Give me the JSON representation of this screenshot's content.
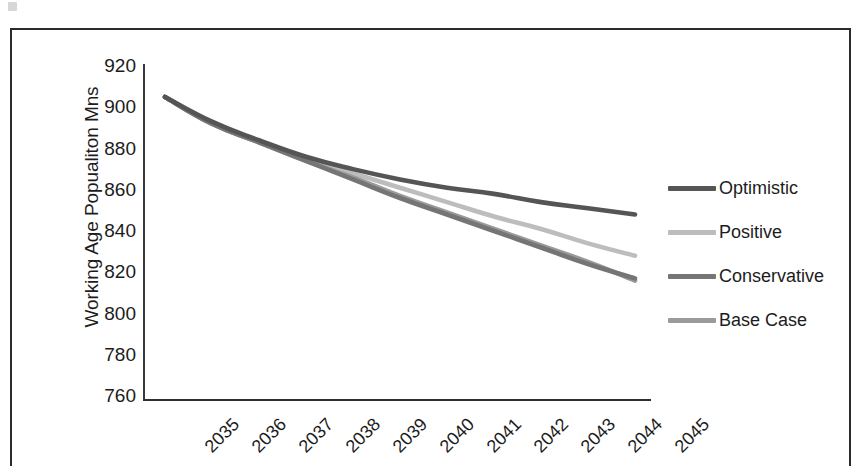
{
  "chart_data": {
    "type": "line",
    "title": "",
    "xlabel": "",
    "ylabel": "Working Age Popualiton Mns",
    "x": [
      2035,
      2036,
      2037,
      2038,
      2039,
      2040,
      2041,
      2042,
      2043,
      2044,
      2045
    ],
    "categories": [
      "2035",
      "2036",
      "2037",
      "2038",
      "2039",
      "2040",
      "2041",
      "2042",
      "2043",
      "2044",
      "2045"
    ],
    "ylim": [
      760,
      920
    ],
    "yticks": [
      920,
      900,
      880,
      860,
      840,
      820,
      800,
      780,
      760
    ],
    "ytick_labels": [
      "920",
      "900",
      "880",
      "860",
      "840",
      "820",
      "800",
      "780",
      "760"
    ],
    "grid": false,
    "legend_position": "right",
    "series": [
      {
        "name": "Optimistic",
        "color": "#555555",
        "values": [
          905,
          893,
          884,
          876,
          870,
          865,
          861,
          858,
          854,
          851,
          848
        ]
      },
      {
        "name": "Positive",
        "color": "#bdbdbd",
        "values": [
          905,
          892,
          883,
          875,
          868,
          861,
          854,
          847,
          841,
          834,
          828
        ]
      },
      {
        "name": "Conservative",
        "color": "#757575",
        "values": [
          905,
          892,
          883,
          874,
          865,
          856,
          848,
          840,
          832,
          824,
          817
        ]
      },
      {
        "name": "Base Case",
        "color": "#9a9a9a",
        "values": [
          905,
          892,
          883,
          874,
          866,
          857,
          849,
          841,
          833,
          825,
          816
        ]
      }
    ]
  },
  "legend": {
    "items": [
      {
        "label": "Optimistic",
        "color": "#555555"
      },
      {
        "label": "Positive",
        "color": "#bdbdbd"
      },
      {
        "label": "Conservative",
        "color": "#757575"
      },
      {
        "label": "Base Case",
        "color": "#9a9a9a"
      }
    ]
  }
}
